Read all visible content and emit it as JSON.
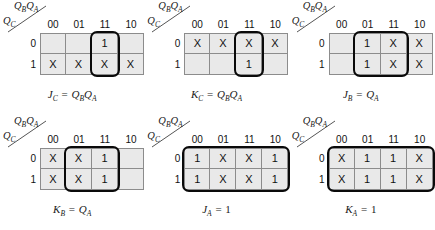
{
  "figure": {
    "name": "jk-flip-flop-karnaugh-maps",
    "axis_top_label": "QBQA",
    "axis_left_label": "QC",
    "column_headers": [
      "00",
      "01",
      "11",
      "10"
    ],
    "row_headers": [
      "0",
      "1"
    ]
  },
  "maps": [
    {
      "id": "jc",
      "caption_lhs": "J",
      "caption_lhs_sub": "C",
      "caption_eq": "=",
      "caption_rhs": "QBQA",
      "caption_text": "JC = QBQA",
      "rows": [
        [
          "",
          "",
          "1",
          ""
        ],
        [
          "X",
          "X",
          "X",
          "X"
        ]
      ],
      "group": {
        "col": 2,
        "row": 0,
        "cols": 1,
        "rows": 2
      }
    },
    {
      "id": "kc",
      "caption_lhs": "K",
      "caption_lhs_sub": "C",
      "caption_eq": "=",
      "caption_rhs": "QBQA",
      "caption_text": "KC = QBQA",
      "rows": [
        [
          "X",
          "X",
          "X",
          "X"
        ],
        [
          "",
          "",
          "1",
          ""
        ]
      ],
      "group": {
        "col": 2,
        "row": 0,
        "cols": 1,
        "rows": 2
      }
    },
    {
      "id": "jb",
      "caption_lhs": "J",
      "caption_lhs_sub": "B",
      "caption_eq": "=",
      "caption_rhs": "QA",
      "caption_text": "JB = QA",
      "rows": [
        [
          "",
          "1",
          "X",
          "X"
        ],
        [
          "",
          "1",
          "X",
          "X"
        ]
      ],
      "group": {
        "col": 1,
        "row": 0,
        "cols": 2,
        "rows": 2
      }
    },
    {
      "id": "kb",
      "caption_lhs": "K",
      "caption_lhs_sub": "B",
      "caption_eq": "=",
      "caption_rhs": "QA",
      "caption_text": "KB = QA",
      "rows": [
        [
          "X",
          "X",
          "1",
          ""
        ],
        [
          "X",
          "X",
          "1",
          ""
        ]
      ],
      "group": {
        "col": 1,
        "row": 0,
        "cols": 2,
        "rows": 2
      }
    },
    {
      "id": "ja",
      "caption_lhs": "J",
      "caption_lhs_sub": "A",
      "caption_eq": "=",
      "caption_rhs": "1",
      "caption_rhs_plain": true,
      "caption_text": "JA = 1",
      "rows": [
        [
          "1",
          "X",
          "X",
          "1"
        ],
        [
          "1",
          "X",
          "X",
          "1"
        ]
      ],
      "group": {
        "col": 0,
        "row": 0,
        "cols": 4,
        "rows": 2
      }
    },
    {
      "id": "ka",
      "caption_lhs": "K",
      "caption_lhs_sub": "A",
      "caption_eq": "=",
      "caption_rhs": "1",
      "caption_rhs_plain": true,
      "caption_text": "KA = 1",
      "rows": [
        [
          "X",
          "1",
          "1",
          "X"
        ],
        [
          "X",
          "1",
          "1",
          "X"
        ]
      ],
      "group": {
        "col": 0,
        "row": 0,
        "cols": 4,
        "rows": 2
      }
    }
  ],
  "colors": {
    "cell_fill": "#e9e9e9",
    "cell_border": "#8c8c8c",
    "group_outline": "#0a0a0a",
    "text": "#111111",
    "background": "#ffffff"
  }
}
